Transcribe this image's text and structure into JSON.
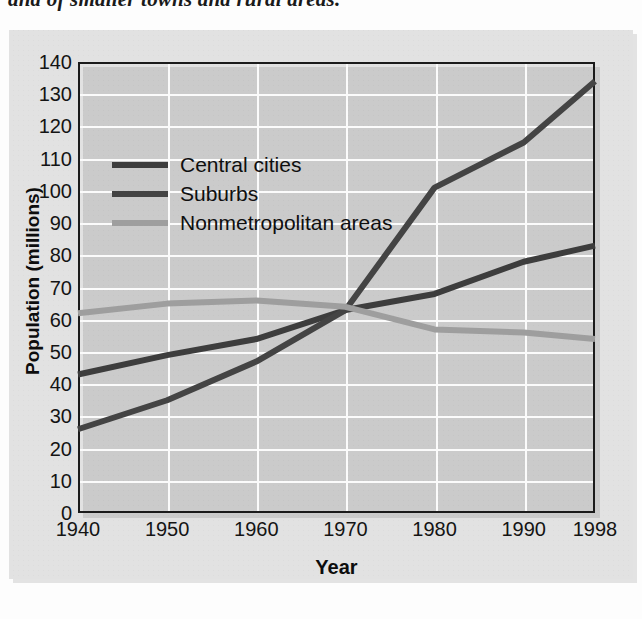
{
  "caption": {
    "text": "and of smaller towns and rural areas."
  },
  "chart_data": {
    "type": "line",
    "title": "",
    "xlabel": "Year",
    "ylabel": "Population (millions)",
    "x": [
      1940,
      1950,
      1960,
      1970,
      1980,
      1990,
      1998
    ],
    "xtick_labels": [
      "1940",
      "1950",
      "1960",
      "1970",
      "1980",
      "1990",
      "1998"
    ],
    "ytick_labels": [
      "0",
      "10",
      "20",
      "30",
      "40",
      "50",
      "60",
      "70",
      "80",
      "90",
      "100",
      "110",
      "120",
      "130",
      "140"
    ],
    "yticks": [
      0,
      10,
      20,
      30,
      40,
      50,
      60,
      70,
      80,
      90,
      100,
      110,
      120,
      130,
      140
    ],
    "ylim": [
      0,
      140
    ],
    "grid": "both",
    "legend_position": "upper-left-inside",
    "series": [
      {
        "name": "Central cities",
        "color": "#3d3d3d",
        "values": [
          43,
          49,
          54,
          63,
          68,
          78,
          83
        ]
      },
      {
        "name": "Suburbs",
        "color": "#444444",
        "values": [
          26,
          35,
          47,
          63,
          101,
          115,
          134
        ]
      },
      {
        "name": "Nonmetropolitan areas",
        "color": "#9e9e9e",
        "values": [
          62,
          65,
          66,
          64,
          57,
          56,
          54
        ]
      }
    ]
  },
  "legend": {
    "items": [
      {
        "label": "Central cities",
        "color": "#3d3d3d"
      },
      {
        "label": "Suburbs",
        "color": "#444444"
      },
      {
        "label": "Nonmetropolitan areas",
        "color": "#9e9e9e"
      }
    ]
  },
  "colors": {
    "panel_background": "#e2e2e2",
    "page_background": "#fdfdfd",
    "axis": "#1b1b1b",
    "gridline": "#fbfbfb",
    "text": "#141414"
  }
}
